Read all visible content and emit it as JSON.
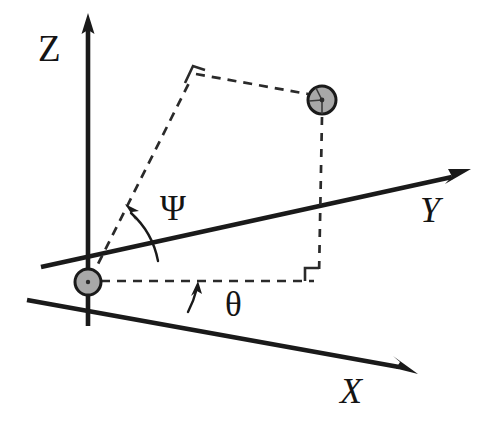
{
  "figure": {
    "kind": "spherical-coordinate-diagram",
    "background_color": "#ffffff",
    "line_color": "#1a1a1a",
    "dash_color": "#2a2a2a",
    "node_fill_color": "#a8a8a8",
    "width": 493,
    "height": 426
  },
  "axes": [
    {
      "id": "z",
      "label": "Z",
      "label_x": 38,
      "label_y": 61,
      "style": "upright",
      "origin": {
        "x": 88,
        "y": 282
      },
      "negative_end": {
        "x": 88,
        "y": 326
      },
      "positive_end": {
        "x": 88,
        "y": 28
      },
      "arrow_tip": {
        "x": 88,
        "y": 14
      }
    },
    {
      "id": "y",
      "label": "Y",
      "label_x": 420,
      "label_y": 222,
      "style": "italic",
      "origin": {
        "x": 88,
        "y": 282
      },
      "negative_end": {
        "x": 41,
        "y": 267
      },
      "positive_end": {
        "x": 452,
        "y": 177
      },
      "arrow_tip": {
        "x": 470,
        "y": 170
      }
    },
    {
      "id": "x",
      "label": "X",
      "label_x": 340,
      "label_y": 403,
      "style": "italic",
      "origin": {
        "x": 88,
        "y": 282
      },
      "negative_end": {
        "x": 27,
        "y": 300
      },
      "positive_end": {
        "x": 398,
        "y": 367
      },
      "arrow_tip": {
        "x": 416,
        "y": 373
      }
    }
  ],
  "angles": [
    {
      "id": "psi",
      "label": "Ψ",
      "label_x": 160,
      "label_y": 220,
      "description": "elevation angle from Y axis up to the radial dashed line",
      "arc": {
        "start_x": 158,
        "start_y": 259,
        "end_x": 130,
        "end_y": 212,
        "radius": 72
      },
      "arrow_tip": {
        "x": 126,
        "y": 206
      }
    },
    {
      "id": "theta",
      "label": "θ",
      "label_x": 225,
      "label_y": 316,
      "description": "azimuth angle from X axis up to the horizontal projection dashed line",
      "arc": {
        "start_x": 190,
        "start_y": 311,
        "end_x": 197,
        "end_y": 288,
        "radius": 106
      },
      "arrow_tip": {
        "x": 197,
        "y": 282
      }
    }
  ],
  "nodes": [
    {
      "id": "origin",
      "role": "coordinate-origin",
      "x": 88,
      "y": 282,
      "radius": 13
    },
    {
      "id": "particle",
      "role": "point-mass-marker",
      "x": 322,
      "y": 100,
      "radius": 14
    }
  ],
  "construction_lines": [
    {
      "id": "radial-line",
      "style": "dashed",
      "points": [
        {
          "x": 88,
          "y": 282
        },
        {
          "x": 192,
          "y": 76
        }
      ]
    },
    {
      "id": "top-connector",
      "style": "dashed",
      "points": [
        {
          "x": 192,
          "y": 76
        },
        {
          "x": 308,
          "y": 97
        }
      ]
    },
    {
      "id": "vertical-drop",
      "style": "dashed",
      "points": [
        {
          "x": 322,
          "y": 116
        },
        {
          "x": 319,
          "y": 281
        }
      ]
    },
    {
      "id": "ground-projection",
      "style": "dashed",
      "points": [
        {
          "x": 101,
          "y": 281
        },
        {
          "x": 319,
          "y": 281
        }
      ]
    }
  ],
  "right_angle_markers": [
    {
      "id": "top-vertex-right-angle",
      "x": 192,
      "y": 76,
      "size": 11
    },
    {
      "id": "base-vertex-right-angle",
      "x": 319,
      "y": 281,
      "size": 13
    }
  ]
}
